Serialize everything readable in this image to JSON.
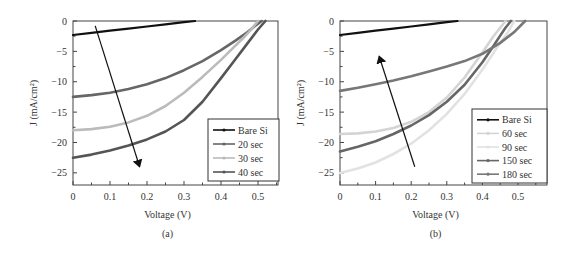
{
  "chart_data": [
    {
      "type": "line",
      "panel_label": "(a)",
      "xlabel": "Voltage (V)",
      "ylabel": "J (mA/cm²)",
      "xlim": [
        0,
        0.55
      ],
      "ylim": [
        -27,
        0
      ],
      "xticks": [
        0,
        0.1,
        0.2,
        0.3,
        0.4,
        0.5
      ],
      "xtick_labels": [
        "0",
        "0.1",
        "0.2",
        "0.3",
        "0.4",
        "0.5"
      ],
      "yticks": [
        0,
        -5,
        -10,
        -15,
        -20,
        -25
      ],
      "ytick_labels": [
        "0",
        "−5",
        "−10",
        "−15",
        "−20",
        "−25"
      ],
      "grid": false,
      "legend_position": "lower right",
      "arrow": {
        "from": [
          0.06,
          -0.8
        ],
        "to": [
          0.18,
          -24.0
        ],
        "meaning": "increasing Jsc with etching time"
      },
      "series": [
        {
          "name": "Bare Si",
          "color": "#111111",
          "width": 2.2,
          "x": [
            0,
            0.05,
            0.1,
            0.15,
            0.2,
            0.25,
            0.3,
            0.33
          ],
          "y": [
            -2.3,
            -1.95,
            -1.6,
            -1.25,
            -0.9,
            -0.55,
            -0.2,
            0
          ]
        },
        {
          "name": "20 sec",
          "color": "#666666",
          "width": 2.6,
          "x": [
            0,
            0.05,
            0.1,
            0.15,
            0.2,
            0.25,
            0.3,
            0.35,
            0.4,
            0.44,
            0.47,
            0.49,
            0.51
          ],
          "y": [
            -12.5,
            -12.2,
            -11.8,
            -11.2,
            -10.4,
            -9.4,
            -8.1,
            -6.6,
            -4.8,
            -3.2,
            -1.9,
            -0.9,
            0
          ]
        },
        {
          "name": "30 sec",
          "color": "#bbbbbb",
          "width": 2.6,
          "x": [
            0,
            0.05,
            0.1,
            0.15,
            0.2,
            0.25,
            0.3,
            0.35,
            0.4,
            0.43,
            0.46,
            0.48,
            0.5
          ],
          "y": [
            -18.0,
            -17.8,
            -17.4,
            -16.7,
            -15.6,
            -14.0,
            -11.8,
            -9.2,
            -6.4,
            -4.6,
            -2.8,
            -1.5,
            0
          ]
        },
        {
          "name": "40 sec",
          "color": "#555555",
          "width": 2.6,
          "marker": "triangle-down",
          "x": [
            0,
            0.05,
            0.1,
            0.15,
            0.2,
            0.25,
            0.3,
            0.35,
            0.4,
            0.44,
            0.47,
            0.5,
            0.52
          ],
          "y": [
            -22.5,
            -22.0,
            -21.3,
            -20.5,
            -19.5,
            -18.2,
            -16.3,
            -13.3,
            -9.4,
            -6.2,
            -3.8,
            -1.4,
            0
          ]
        }
      ]
    },
    {
      "type": "line",
      "panel_label": "(b)",
      "xlabel": "Voltage (V)",
      "ylabel": "J (mA/cm²)",
      "xlim": [
        0,
        0.58
      ],
      "ylim": [
        -27,
        0
      ],
      "xticks": [
        0,
        0.1,
        0.2,
        0.3,
        0.4,
        0.5
      ],
      "xtick_labels": [
        "0",
        "0.1",
        "0.2",
        "0.3",
        "0.4",
        "0.5"
      ],
      "yticks": [
        0,
        -5,
        -10,
        -15,
        -20,
        -25
      ],
      "ytick_labels": [
        "0",
        "−5",
        "−10",
        "−15",
        "−20",
        "−25"
      ],
      "grid": false,
      "legend_position": "lower right",
      "arrow": {
        "from": [
          0.21,
          -24.0
        ],
        "to": [
          0.11,
          -5.8
        ],
        "meaning": "decreasing Jsc with longer etching time"
      },
      "series": [
        {
          "name": "Bare Si",
          "color": "#111111",
          "width": 2.2,
          "x": [
            0,
            0.05,
            0.1,
            0.15,
            0.2,
            0.25,
            0.3,
            0.33
          ],
          "y": [
            -2.3,
            -1.95,
            -1.6,
            -1.25,
            -0.9,
            -0.55,
            -0.2,
            0
          ]
        },
        {
          "name": "60 sec",
          "color": "#d4d4d4",
          "width": 2.6,
          "x": [
            0,
            0.05,
            0.1,
            0.15,
            0.2,
            0.25,
            0.3,
            0.35,
            0.4,
            0.43,
            0.45,
            0.465
          ],
          "y": [
            -18.6,
            -18.5,
            -18.2,
            -17.6,
            -16.6,
            -15.0,
            -12.6,
            -9.3,
            -5.2,
            -2.6,
            -1.1,
            0
          ]
        },
        {
          "name": "90 sec",
          "color": "#e2e2e2",
          "width": 2.6,
          "x": [
            0,
            0.05,
            0.1,
            0.15,
            0.2,
            0.25,
            0.3,
            0.35,
            0.4,
            0.44,
            0.47,
            0.49
          ],
          "y": [
            -25.0,
            -24.3,
            -23.3,
            -21.9,
            -20.2,
            -18.0,
            -15.3,
            -12.0,
            -8.0,
            -4.5,
            -2.0,
            0
          ]
        },
        {
          "name": "150 sec",
          "color": "#666666",
          "width": 2.6,
          "x": [
            0,
            0.05,
            0.1,
            0.15,
            0.2,
            0.25,
            0.3,
            0.35,
            0.4,
            0.43,
            0.45,
            0.465,
            0.48
          ],
          "y": [
            -21.5,
            -20.7,
            -19.8,
            -18.6,
            -17.2,
            -15.5,
            -13.3,
            -10.5,
            -6.8,
            -4.2,
            -2.4,
            -1.1,
            0
          ]
        },
        {
          "name": "180 sec",
          "color": "#777777",
          "width": 2.6,
          "x": [
            0,
            0.05,
            0.1,
            0.15,
            0.2,
            0.25,
            0.3,
            0.35,
            0.4,
            0.45,
            0.49,
            0.52
          ],
          "y": [
            -11.5,
            -11.0,
            -10.4,
            -9.8,
            -9.1,
            -8.3,
            -7.5,
            -6.6,
            -5.4,
            -3.6,
            -1.8,
            0
          ]
        }
      ]
    }
  ],
  "layout": {
    "panels": [
      {
        "plot": {
          "x": 73,
          "y": 21,
          "w": 205,
          "h": 164
        },
        "x_px_per_unit": 370,
        "legend": {
          "x": 208,
          "y": 119,
          "w": 71,
          "h": 62
        }
      },
      {
        "plot": {
          "x": 340,
          "y": 21,
          "w": 207,
          "h": 164
        },
        "x_px_per_unit": 356,
        "legend": {
          "x": 472,
          "y": 109,
          "w": 75,
          "h": 74
        }
      }
    ]
  }
}
